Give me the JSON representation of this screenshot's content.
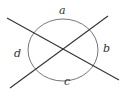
{
  "figure": {
    "labels": {
      "top": "a",
      "right": "b",
      "bottom": "c",
      "left": "d"
    },
    "colors": {
      "line": "#333333",
      "circle": "#666666",
      "background": "#ffffff"
    }
  }
}
